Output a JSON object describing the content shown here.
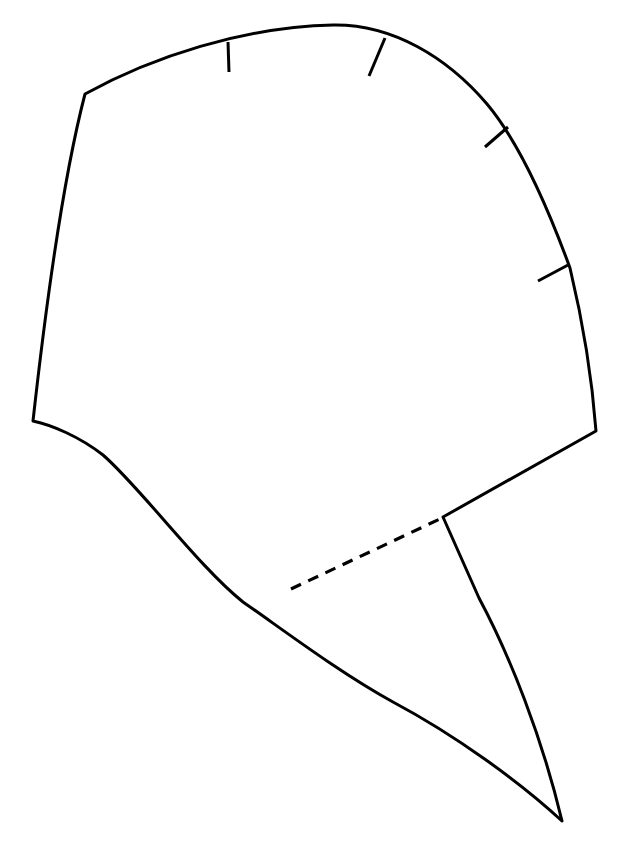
{
  "document": {
    "title": "Sewing Pattern Piece Outline",
    "background_color": "#ffffff",
    "stroke_color": "#000000",
    "canvas_width": 623,
    "canvas_height": 845
  },
  "drawing": {
    "type": "line-drawing",
    "description": "Single closed garment pattern piece outline with four notch marks along the upper curved edge and one dashed internal fold/guide line",
    "stroke_width": 3,
    "units": "px",
    "outline_path": "M 85 94 C 150 58 245 28 333 25 C 420 22 490 62 532 128 C 568 186 588 302 596 431 L 443 517 L 442 517 L 292 588 L 290 593 C 235 558 150 490 103 455 L 33 421 Z",
    "outline_points": [
      {
        "name": "top-left-corner",
        "x": 85,
        "y": 94
      },
      {
        "name": "top-apex",
        "x": 333,
        "y": 25
      },
      {
        "name": "upper-right-arc-1",
        "x": 382,
        "y": 37
      },
      {
        "name": "upper-right-arc-2",
        "x": 507,
        "y": 128
      },
      {
        "name": "upper-right-arc-3",
        "x": 570,
        "y": 268
      },
      {
        "name": "right-corner",
        "x": 596,
        "y": 431
      },
      {
        "name": "mid-notch-vertex",
        "x": 443,
        "y": 517
      },
      {
        "name": "tail-tip",
        "x": 562,
        "y": 821
      },
      {
        "name": "fold-lower-end",
        "x": 291,
        "y": 589
      },
      {
        "name": "lower-left-curve",
        "x": 200,
        "y": 512
      },
      {
        "name": "left-corner",
        "x": 33,
        "y": 421
      }
    ],
    "fold_line": {
      "name": "dashed-fold-line",
      "style": "dashed",
      "dash_length": 11,
      "gap_length": 8,
      "start": {
        "x": 291,
        "y": 589
      },
      "end": {
        "x": 442,
        "y": 518
      }
    },
    "notches": [
      {
        "id": 1,
        "x1": 228,
        "y1": 42,
        "x2": 229,
        "y2": 72
      },
      {
        "id": 2,
        "x1": 385,
        "y1": 38,
        "x2": 369,
        "y2": 76
      },
      {
        "id": 3,
        "x1": 508,
        "y1": 127,
        "x2": 485,
        "y2": 147
      },
      {
        "id": 4,
        "x1": 568,
        "y1": 265,
        "x2": 538,
        "y2": 281
      }
    ]
  }
}
